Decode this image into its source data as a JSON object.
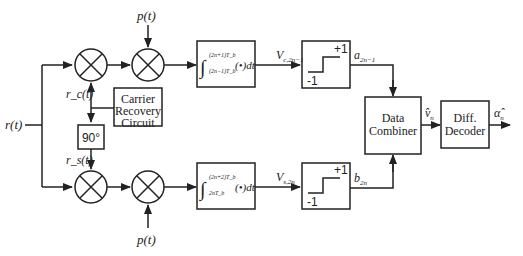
{
  "diagram": {
    "input": {
      "label": "r(t)"
    },
    "pulse_inputs": {
      "top": "p(t)",
      "bottom": "p(t)"
    },
    "carrier_refs": {
      "cosine": "r_c(t)",
      "sine": "r_s(t)"
    },
    "blocks": {
      "carrier_recovery": {
        "lines": [
          "Carrier",
          "Recovery",
          "Circuit"
        ]
      },
      "phase_shift": {
        "label": "90°"
      },
      "integrator_top": {
        "upper_limit": "(2n+1)T_b",
        "lower_limit": "(2n−1)T_b",
        "body": "(•)dt"
      },
      "integrator_bottom": {
        "upper_limit": "(2n+2)T_b",
        "lower_limit": "2nT_b",
        "body": "(•)dt"
      },
      "slicer_top": {
        "high": "+1",
        "low": "-1"
      },
      "slicer_bottom": {
        "high": "+1",
        "low": "-1"
      },
      "data_combiner": {
        "lines": [
          "Data",
          "Combiner"
        ]
      },
      "diff_decoder": {
        "lines": [
          "Diff.",
          "Decoder"
        ]
      }
    },
    "signals": {
      "v_top": {
        "main": "V",
        "sub": "c,2n−1"
      },
      "v_bottom": {
        "main": "V",
        "sub": "s,2n"
      },
      "a_out": {
        "main": "a",
        "sub": "2n−1"
      },
      "b_out": {
        "main": "b",
        "sub": "2n"
      },
      "v_hat": {
        "main": "v̂",
        "sub": "n"
      },
      "alpha_hat": {
        "main": "α̂",
        "sub": "n"
      }
    }
  }
}
